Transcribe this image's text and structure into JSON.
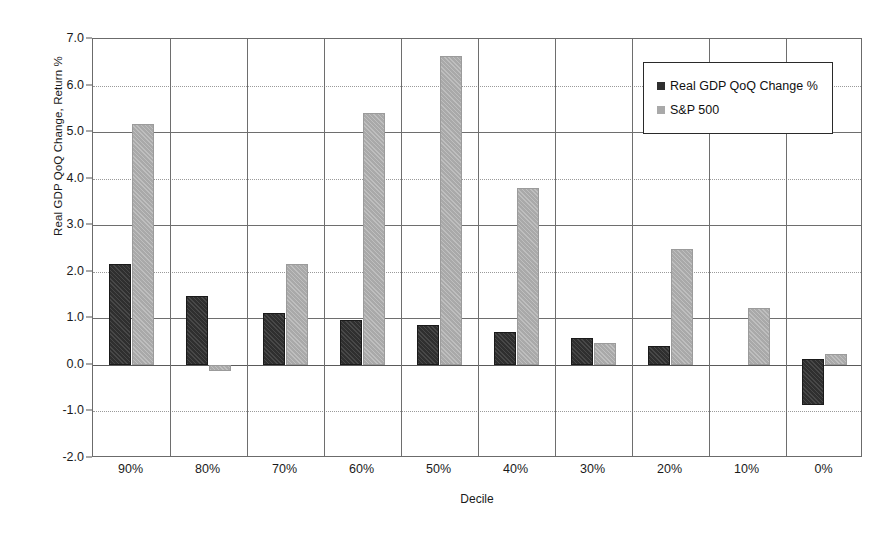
{
  "chart_data": {
    "type": "bar",
    "title": "",
    "xlabel": "Decile",
    "ylabel": "Real GDP QoQ Change, Return %",
    "categories": [
      "90%",
      "80%",
      "70%",
      "60%",
      "50%",
      "40%",
      "30%",
      "20%",
      "10%",
      "0%"
    ],
    "ylim": [
      -2.0,
      7.0
    ],
    "ytick_labels": [
      "7.0",
      "6.0",
      "5.0",
      "4.0",
      "3.0",
      "2.0",
      "1.0",
      "0.0",
      "-1.0",
      "-2.0"
    ],
    "ytick_values": [
      7.0,
      6.0,
      5.0,
      4.0,
      3.0,
      2.0,
      1.0,
      0.0,
      -1.0,
      -2.0
    ],
    "grid": true,
    "legend_position": "upper right",
    "series": [
      {
        "name": "Real GDP QoQ Change %",
        "color": "#2f2f2f",
        "values": [
          2.17,
          1.48,
          1.12,
          0.97,
          0.86,
          0.71,
          0.58,
          0.41,
          0.0,
          -0.87
        ],
        "bar_bottoms": [
          0,
          0,
          0,
          0,
          0,
          0,
          0,
          0,
          0,
          0.13
        ]
      },
      {
        "name": "S&P 500",
        "color": "#a9a9a9",
        "values": [
          5.17,
          -0.13,
          2.17,
          5.4,
          6.63,
          3.8,
          0.48,
          2.49,
          1.23,
          0.24
        ],
        "bar_bottoms": [
          0,
          0,
          0,
          0,
          0,
          0,
          0,
          0,
          0,
          0
        ]
      }
    ]
  },
  "legend": {
    "items": [
      {
        "label": "Real GDP QoQ Change %",
        "swatch": "gdp"
      },
      {
        "label": "S&P 500",
        "swatch": "sp"
      }
    ]
  }
}
